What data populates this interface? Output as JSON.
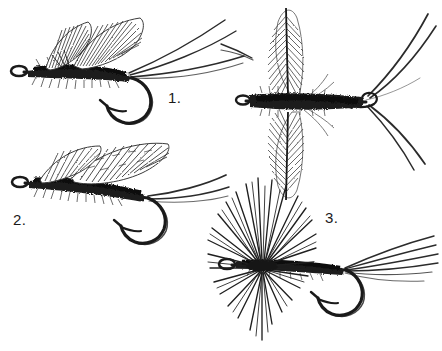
{
  "plate": {
    "title": "Artificial fly patterns",
    "medium": "pen-and-ink line illustration",
    "background_color": "#ffffff",
    "ink_color": "#1a1a1a",
    "width": 442,
    "height": 351
  },
  "labels": [
    {
      "id": "label-1",
      "text": "1.",
      "x": 168,
      "y": 90
    },
    {
      "id": "label-2",
      "text": "2.",
      "x": 13,
      "y": 212
    },
    {
      "id": "label-3",
      "text": "3.",
      "x": 325,
      "y": 210
    }
  ],
  "figures": [
    {
      "key": "fly-upright-wing-dun",
      "name": "Upright-wing dry fly (dun)",
      "label": "1.",
      "position": "top-left",
      "view": "side",
      "parts": [
        "hook",
        "hook-eye",
        "dubbed-body",
        "upright-wings",
        "tail-fibers"
      ],
      "tail_count": 3,
      "wing_count": 2
    },
    {
      "key": "fly-swept-wing",
      "name": "Swept-back wing wet fly",
      "label": "2.",
      "position": "mid-left",
      "view": "side",
      "parts": [
        "hook",
        "hook-eye",
        "shaggy-body",
        "swept-wings",
        "tail-fibers"
      ],
      "tail_count": 2,
      "wing_count": 2
    },
    {
      "key": "fly-spent-spinner",
      "name": "Spent-wing spinner",
      "label": "",
      "position": "top-right",
      "view": "top",
      "parts": [
        "hook",
        "hook-eye",
        "dubbed-body",
        "spent-wings",
        "splayed-tails"
      ],
      "tail_count": 4,
      "wing_count": 2
    },
    {
      "key": "fly-hackled-dry",
      "name": "Hackled dry fly",
      "label": "3.",
      "position": "bottom-right",
      "view": "side",
      "parts": [
        "hook",
        "hook-eye",
        "tapered-body",
        "radial-hackle",
        "tail-fan"
      ],
      "tail_count": 6,
      "hackle_fibers": 46
    }
  ]
}
